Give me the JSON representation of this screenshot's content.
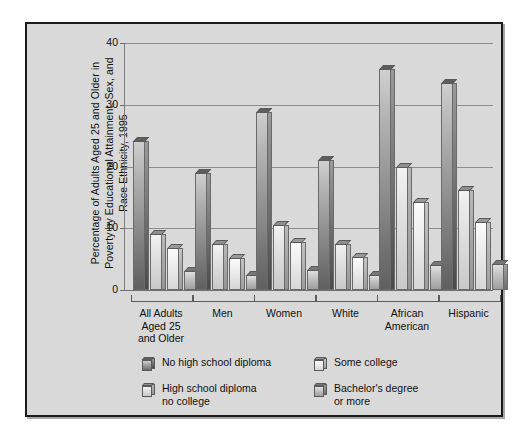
{
  "chart_data": {
    "type": "bar",
    "title": "",
    "ylabel": "Percentage of Adults Aged 25 and Older in\nPoverty by Educational Attainment, Sex, and\nRace Ethnicity, 1995",
    "xlabel": "",
    "ylim": [
      0,
      40
    ],
    "yticks": [
      "0",
      "10",
      "20",
      "30",
      "40"
    ],
    "grid": true,
    "legend_position": "bottom",
    "categories": [
      "All Adults\nAged 25\nand Older",
      "Men",
      "Women",
      "White",
      "African\nAmerican",
      "Hispanic"
    ],
    "series": [
      {
        "name": "No high school diploma",
        "values": [
          24.2,
          19.0,
          28.8,
          21.0,
          35.8,
          33.5
        ]
      },
      {
        "name": "High school diploma\nno college",
        "values": [
          9.0,
          7.5,
          10.5,
          7.5,
          20.0,
          16.2
        ]
      },
      {
        "name": "Some college",
        "values": [
          6.8,
          5.2,
          7.8,
          5.3,
          14.3,
          11.0
        ]
      },
      {
        "name": "Bachelor's degree\nor more",
        "values": [
          3.0,
          2.5,
          3.2,
          2.4,
          4.0,
          4.2
        ]
      }
    ],
    "colors": {
      "series1": "#8f8f8f",
      "series2": "#e2e2e2",
      "series3": "#ededed",
      "series4": "#c6c6c6",
      "background": "#d9d9d9",
      "frame": "#1b1b1b",
      "gridline": "#8d8d8d"
    }
  },
  "legend": {
    "items": [
      "No high school diploma",
      "High school diploma\nno college",
      "Some college",
      "Bachelor's degree\nor more"
    ]
  }
}
